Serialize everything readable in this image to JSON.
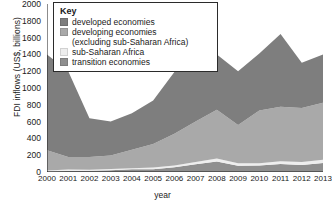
{
  "chart_data": {
    "type": "area",
    "stacked": true,
    "title": "",
    "xlabel": "year",
    "ylabel": "FDI inflows (US$, billions)",
    "categories": [
      "2000",
      "2001",
      "2002",
      "2003",
      "2004",
      "2005",
      "2006",
      "2007",
      "2008",
      "2009",
      "2010",
      "2011",
      "2012",
      "2013"
    ],
    "x": [
      2000,
      2001,
      2002,
      2003,
      2004,
      2005,
      2006,
      2007,
      2008,
      2009,
      2010,
      2011,
      2012,
      2013
    ],
    "ylim": [
      0,
      2000
    ],
    "yticks": [
      0,
      200,
      400,
      600,
      800,
      1000,
      1200,
      1400,
      1600,
      1800,
      2000
    ],
    "grid": false,
    "legend_position": "top-left",
    "legend_title": "Key",
    "series": [
      {
        "name": "transition economies",
        "color": "#8f8f8f",
        "values": [
          10,
          12,
          14,
          20,
          32,
          32,
          58,
          92,
          124,
          74,
          76,
          94,
          84,
          108
        ]
      },
      {
        "name": "sub-Saharan Africa",
        "color": "#eeeeee",
        "values": [
          8,
          18,
          14,
          16,
          14,
          22,
          18,
          28,
          36,
          30,
          28,
          34,
          34,
          38
        ]
      },
      {
        "name": "developing economies (excluding sub-Saharan Africa)",
        "color": "#a9a9a9",
        "values": [
          240,
          150,
          150,
          160,
          220,
          280,
          380,
          480,
          580,
          456,
          628,
          648,
          644,
          678
        ]
      },
      {
        "name": "developed economies",
        "color": "#7e7e7e",
        "values": [
          1142,
          1020,
          462,
          404,
          434,
          516,
          734,
          1370,
          660,
          640,
          678,
          868,
          538,
          576
        ]
      }
    ],
    "totals": [
      1400,
      1200,
      640,
      600,
      700,
      850,
      1190,
      1970,
      1400,
      1200,
      1410,
      1644,
      1300,
      1400
    ]
  },
  "legend": {
    "title": "Key",
    "items": [
      {
        "label": "developed economies",
        "cont": "",
        "color": "#7e7e7e"
      },
      {
        "label": "developing economies",
        "cont": "(excluding sub-Saharan Africa)",
        "color": "#a9a9a9"
      },
      {
        "label": "sub-Saharan Africa",
        "cont": "",
        "color": "#eeeeee"
      },
      {
        "label": "transition economies",
        "cont": "",
        "color": "#8f8f8f"
      }
    ]
  },
  "axes": {
    "y_title": "FDI inflows (US$, billions)",
    "x_title": "year",
    "y_tick_labels": [
      "2000",
      "1800",
      "1600",
      "1400",
      "1200",
      "1000",
      "800",
      "600",
      "400",
      "200",
      "0"
    ],
    "x_tick_labels": [
      "2000",
      "2001",
      "2002",
      "2003",
      "2004",
      "2005",
      "2006",
      "2007",
      "2008",
      "2009",
      "2010",
      "2011",
      "2012",
      "2013"
    ]
  }
}
